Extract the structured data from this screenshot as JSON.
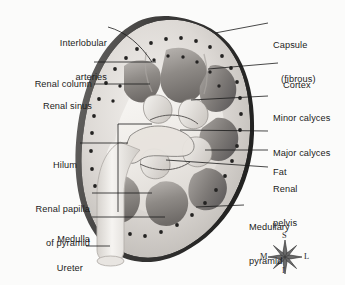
{
  "figure": {
    "background_color": "#fbfbfa",
    "ink_color": "#1b1b1b",
    "capsule_color": "#3a3a3a",
    "cortex_color": "#d9d6d2",
    "medulla_color": "#8f8c89",
    "sinus_fat_color": "#efece8"
  },
  "labels_left": [
    {
      "id": "interlobular-arteries",
      "lines": [
        "Interlobular",
        "arteries"
      ],
      "x": 5,
      "y": 16,
      "w": 102,
      "align": "right"
    },
    {
      "id": "renal-column",
      "lines": [
        "Renal column"
      ],
      "x": 5,
      "y": 57,
      "w": 87,
      "align": "right"
    },
    {
      "id": "renal-sinus",
      "lines": [
        "Renal sinus"
      ],
      "x": 5,
      "y": 79,
      "w": 87,
      "align": "right"
    },
    {
      "id": "hilum",
      "lines": [
        "Hilum"
      ],
      "x": 5,
      "y": 138,
      "w": 72,
      "align": "right"
    },
    {
      "id": "renal-papilla-of-pyramid",
      "lines": [
        "Renal papilla",
        "of pyramid"
      ],
      "x": 5,
      "y": 182,
      "w": 85,
      "align": "right"
    },
    {
      "id": "medulla",
      "lines": [
        "Medulla"
      ],
      "x": 5,
      "y": 212,
      "w": 85,
      "align": "right"
    },
    {
      "id": "ureter",
      "lines": [
        "Ureter"
      ],
      "x": 5,
      "y": 241,
      "w": 78,
      "align": "right"
    }
  ],
  "labels_right": [
    {
      "id": "capsule-fibrous",
      "lines": [
        "Capsule",
        "(fibrous)"
      ],
      "x": 273,
      "y": 18,
      "align": "left",
      "indent_second": 8
    },
    {
      "id": "cortex",
      "lines": [
        "Cortex"
      ],
      "x": 283,
      "y": 58,
      "align": "left",
      "indent_second": 0
    },
    {
      "id": "minor-calyces",
      "lines": [
        "Minor calyces"
      ],
      "x": 273,
      "y": 91,
      "align": "left",
      "indent_second": 0
    },
    {
      "id": "major-calyces",
      "lines": [
        "Major calyces"
      ],
      "x": 273,
      "y": 126,
      "align": "left",
      "indent_second": 0
    },
    {
      "id": "fat",
      "lines": [
        "Fat"
      ],
      "x": 273,
      "y": 145,
      "align": "left",
      "indent_second": 0
    },
    {
      "id": "renal-pelvis",
      "lines": [
        "Renal",
        "pelvis"
      ],
      "x": 273,
      "y": 162,
      "align": "left",
      "indent_second": 0
    },
    {
      "id": "medullary-pyramid",
      "lines": [
        "Medullary",
        "pyramid"
      ],
      "x": 249,
      "y": 200,
      "align": "left",
      "indent_second": 0
    }
  ],
  "compass": {
    "name": "anatomical-orientation-compass",
    "center_x": 285,
    "center_y": 257,
    "superior": "S",
    "inferior": "I",
    "medial": "M",
    "lateral": "L"
  },
  "leader_lines": [
    {
      "from": "interlobular-arteries",
      "d": "M108,27 C126,32 140,44 152,62"
    },
    {
      "from": "renal-column",
      "d": "M94,62 L156,62"
    },
    {
      "from": "renal-sinus",
      "d": "M94,84 L150,84"
    },
    {
      "from": "hilum",
      "d": "M80,143 L128,143"
    },
    {
      "from": "renal-papilla-of-pyramid",
      "d": "M92,193 L152,193"
    },
    {
      "from": "medulla",
      "d": "M92,217 L165,217"
    },
    {
      "from": "ureter",
      "d": "M86,246 L110,246"
    },
    {
      "from": "capsule-fibrous",
      "d": "M268,23 L215,33"
    },
    {
      "from": "cortex",
      "d": "M278,63 L208,69"
    },
    {
      "from": "minor-calyces",
      "d": "M268,96 L191,100"
    },
    {
      "from": "major-calyces",
      "d": "M268,131 L180,130"
    },
    {
      "from": "fat",
      "d": "M268,150 L205,150"
    },
    {
      "from": "renal-pelvis",
      "d": "M268,167 L166,160"
    },
    {
      "from": "medullary-pyramid",
      "d": "M244,205 L196,207"
    }
  ]
}
